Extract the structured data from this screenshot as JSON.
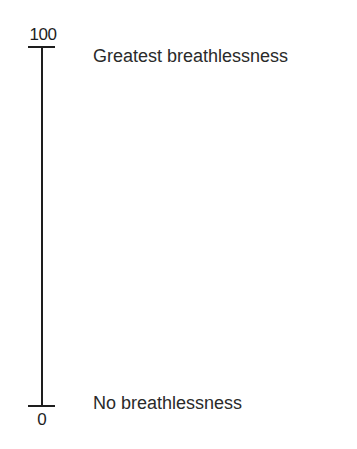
{
  "scale": {
    "type": "visual-analogue-scale",
    "orientation": "vertical",
    "max": {
      "value_label": "100",
      "anchor_text": "Greatest breathlessness"
    },
    "min": {
      "value_label": "0",
      "anchor_text": "No breathlessness"
    },
    "colors": {
      "line": "#1e1e1e",
      "text": "#2a2a2a",
      "background": "#ffffff"
    }
  }
}
